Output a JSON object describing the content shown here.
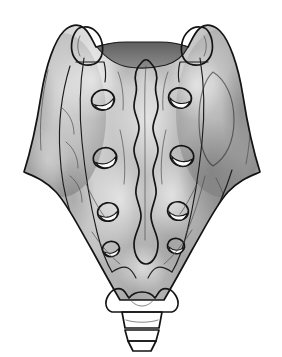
{
  "figure": {
    "title": "Sacrum and coccyx, posterior (dorsal) view",
    "subject": "sacrum",
    "view": "posterior",
    "style": "grayscale shaded line illustration",
    "background_color": "#ffffff",
    "canvas": {
      "width": 282,
      "height": 357
    }
  },
  "palette": {
    "outline": "#141414",
    "bone_light": "#e8e8e8",
    "bone_mid": "#b8b8b8",
    "bone_base": "#a8a8a8",
    "bone_shadow": "#8a8a8a",
    "bone_deep_shadow": "#6f6f6f",
    "foramen_dark": "#7a7a7a",
    "foramen_highlight": "#fbfbfb",
    "canal_dark": "#6e6e6e",
    "process_light": "#efefef"
  },
  "parts": [
    {
      "id": "sacral-body",
      "label": "Sacral body",
      "shape": "inverted triangle / wedge",
      "fill": "#a8a8a8"
    },
    {
      "id": "ala-left",
      "label": "Left sacral ala (wing)",
      "side": "left",
      "fill": "#b0b0b0"
    },
    {
      "id": "ala-right",
      "label": "Right sacral ala (wing)",
      "side": "right",
      "fill": "#9e9e9e"
    },
    {
      "id": "superior-articular-process-left",
      "label": "Left superior articular process",
      "side": "left",
      "fill": "#efefef"
    },
    {
      "id": "superior-articular-process-right",
      "label": "Right superior articular process",
      "side": "right",
      "fill": "#ececec"
    },
    {
      "id": "sacral-canal",
      "label": "Sacral canal opening",
      "fill": "#6e6e6e"
    },
    {
      "id": "median-sacral-crest",
      "label": "Median sacral crest",
      "description": "wavy vertical midline ridge with four tubercle bulges"
    },
    {
      "id": "sacral-hiatus",
      "label": "Sacral hiatus",
      "fill": "#8d8d8d"
    },
    {
      "id": "sacral-cornua",
      "label": "Sacral cornua",
      "count": 2
    },
    {
      "id": "coccyx",
      "label": "Coccyx",
      "segments": 3
    },
    {
      "id": "auricular-surface-right",
      "label": "Right auricular surface",
      "side": "right"
    },
    {
      "id": "lateral-crest-left",
      "label": "Left lateral sacral crest",
      "side": "left"
    }
  ],
  "foramina": {
    "label": "Posterior sacral foramina",
    "pairs": 4,
    "total": 8,
    "appearance": {
      "rim": "#141414",
      "cavity": "#7a7a7a",
      "highlight": "#fbfbfb",
      "highlight_position": "inferomedial crescent"
    },
    "left_side": [
      {
        "index": 1,
        "cx": 103,
        "cy": 100,
        "rx": 11.5,
        "ry": 10.0,
        "rotate": -14
      },
      {
        "index": 2,
        "cx": 105,
        "cy": 158,
        "rx": 11.8,
        "ry": 10.2,
        "rotate": -12
      },
      {
        "index": 3,
        "cx": 108,
        "cy": 212,
        "rx": 10.4,
        "ry": 9.2,
        "rotate": -10
      },
      {
        "index": 4,
        "cx": 111,
        "cy": 249,
        "rx": 8.6,
        "ry": 7.6,
        "rotate": -8
      }
    ],
    "right_side": [
      {
        "index": 1,
        "cx": 180,
        "cy": 98,
        "rx": 11.5,
        "ry": 10.0,
        "rotate": 14
      },
      {
        "index": 2,
        "cx": 182,
        "cy": 156,
        "rx": 11.8,
        "ry": 10.2,
        "rotate": 12
      },
      {
        "index": 3,
        "cx": 178,
        "cy": 211,
        "rx": 10.4,
        "ry": 9.2,
        "rotate": 10
      },
      {
        "index": 4,
        "cx": 176,
        "cy": 246,
        "rx": 8.6,
        "ry": 7.6,
        "rotate": 8
      }
    ]
  },
  "coccyx_segments": [
    {
      "index": 1,
      "label": "Co1",
      "y_top": 312,
      "y_bottom": 328
    },
    {
      "index": 2,
      "label": "Co2",
      "y_top": 328,
      "y_bottom": 340
    },
    {
      "index": 3,
      "label": "Co3",
      "y_top": 340,
      "y_bottom": 350
    }
  ]
}
